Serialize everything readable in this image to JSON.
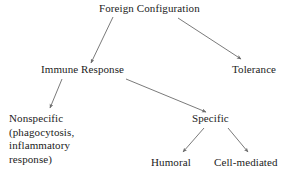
{
  "diagram": {
    "title": "Foreign Configuration",
    "type": "flowchart",
    "background_color": "#ffffff",
    "text_color": "#222222",
    "arrow_color": "#6b6b6b",
    "nodes": {
      "foreign_configuration": {
        "label": "Foreign Configuration",
        "level": 0
      },
      "immune_response": {
        "label": "Immune Response",
        "level": 1
      },
      "tolerance": {
        "label": "Tolerance",
        "level": 1
      },
      "nonspecific": {
        "lines": [
          "Nonspecific",
          "(phagocytosis,",
          "inflammatory",
          "response)"
        ],
        "level": 2
      },
      "specific": {
        "label": "Specific",
        "level": 2
      },
      "humoral": {
        "label": "Humoral",
        "level": 3
      },
      "cell_mediated": {
        "label": "Cell-mediated",
        "level": 3
      }
    },
    "edges": [
      {
        "from": "foreign_configuration",
        "to": "immune_response"
      },
      {
        "from": "foreign_configuration",
        "to": "tolerance"
      },
      {
        "from": "immune_response",
        "to": "nonspecific"
      },
      {
        "from": "immune_response",
        "to": "specific"
      },
      {
        "from": "specific",
        "to": "humoral"
      },
      {
        "from": "specific",
        "to": "cell_mediated"
      }
    ]
  }
}
